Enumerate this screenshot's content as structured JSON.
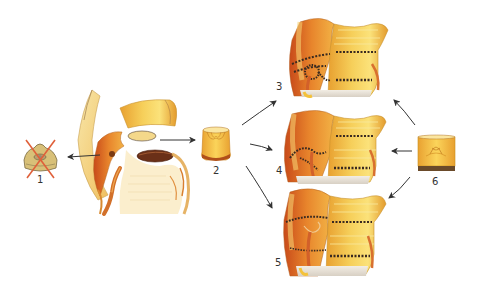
{
  "figure": {
    "type": "surgical-illustration",
    "colors": {
      "tissue_light": "#f7d98a",
      "tissue_mid": "#f0b040",
      "tissue_dark": "#d9701f",
      "tissue_red": "#c8401a",
      "suture": "#3a2a20",
      "arrow": "#333333",
      "cross": "#e0603a",
      "background": "#ffffff"
    }
  },
  "labels": {
    "l1": "1",
    "l2": "2",
    "l3": "3",
    "l4": "4",
    "l5": "5",
    "l6": "6"
  },
  "panels": [
    {
      "id": "1",
      "description": "Excised native valve, crossed out"
    },
    {
      "id": "2",
      "description": "Cylindrical graft (stentless valve)"
    },
    {
      "id": "3",
      "description": "Root replacement with coronary button reimplantation"
    },
    {
      "id": "4",
      "description": "Subcoronary implantation variant"
    },
    {
      "id": "5",
      "description": "Inclusion / root technique variant"
    },
    {
      "id": "6",
      "description": "Cylindrical graft with valve leaflets"
    }
  ]
}
